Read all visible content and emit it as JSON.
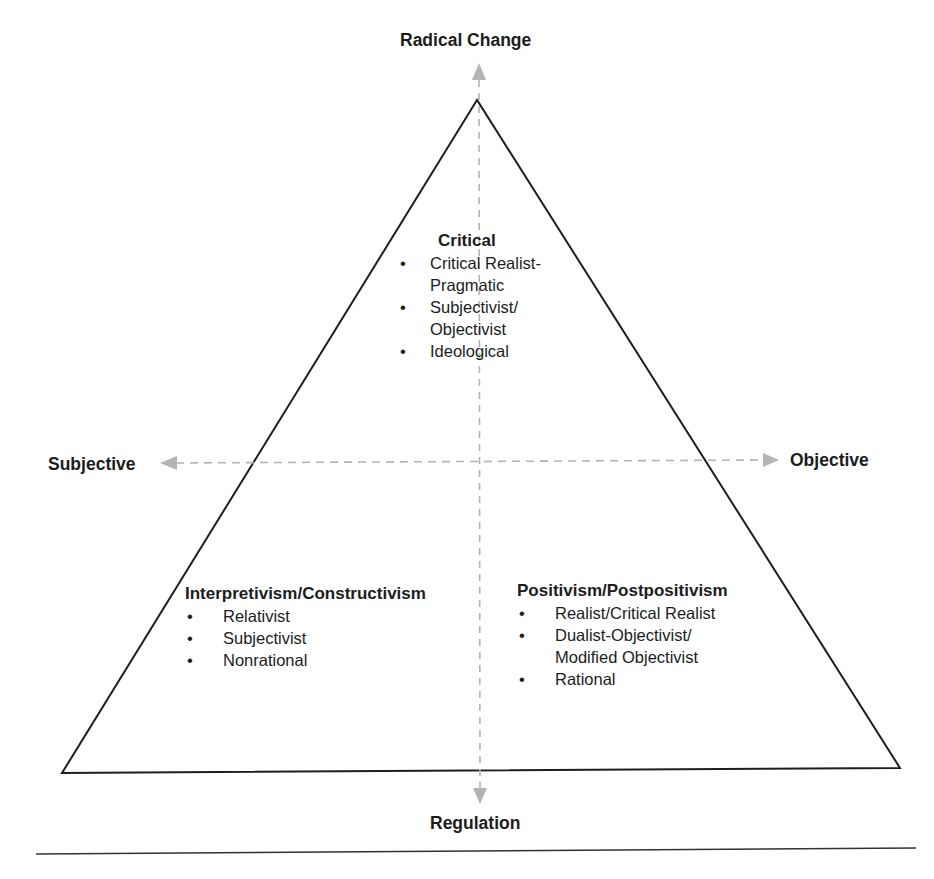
{
  "axes": {
    "top": "Radical Change",
    "bottom": "Regulation",
    "left": "Subjective",
    "right": "Objective"
  },
  "paradigms": {
    "critical": {
      "title": "Critical",
      "items": [
        {
          "line1": "Critical Realist-",
          "line2": "Pragmatic"
        },
        {
          "line1": "Subjectivist/",
          "line2": "Objectivist"
        },
        {
          "line1": "Ideological",
          "line2": ""
        }
      ]
    },
    "interpretivism": {
      "title": "Interpretivism/Constructivism",
      "items": [
        "Relativist",
        "Subjectivist",
        "Nonrational"
      ]
    },
    "positivism": {
      "title": "Positivism/Postpositivism",
      "items": [
        {
          "line1": "Realist/Critical Realist",
          "line2": ""
        },
        {
          "line1": "Dualist-Objectivist/",
          "line2": "Modified Objectivist"
        },
        {
          "line1": "Rational",
          "line2": ""
        }
      ]
    }
  },
  "bullet_glyph": "•",
  "colors": {
    "line": "#1e1e1e",
    "arrow": "#b4b4b4",
    "text": "#1c1c1c"
  }
}
